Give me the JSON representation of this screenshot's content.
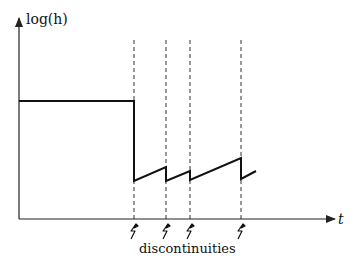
{
  "diagram": {
    "y_axis_label": "log(h)",
    "x_axis_label": "t",
    "annotation": "discontinuities",
    "colors": {
      "line": "#111111",
      "dashed": "#333333",
      "axis": "#222222",
      "background": "#ffffff"
    },
    "discontinuity_markers": [
      {
        "x": 134,
        "icon": "lightning-icon"
      },
      {
        "x": 166,
        "icon": "lightning-icon"
      },
      {
        "x": 190,
        "icon": "lightning-icon"
      },
      {
        "x": 241,
        "icon": "lightning-icon"
      }
    ],
    "curve_points": [
      [
        19,
        101
      ],
      [
        134,
        101
      ],
      [
        134,
        181
      ],
      [
        166,
        167
      ],
      [
        166,
        181
      ],
      [
        190,
        171
      ],
      [
        190,
        180
      ],
      [
        241,
        158
      ],
      [
        241,
        179
      ],
      [
        256,
        171
      ]
    ]
  }
}
